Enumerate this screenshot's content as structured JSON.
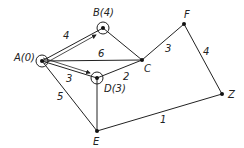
{
  "diagram": {
    "type": "weighted-graph",
    "nodes": [
      {
        "id": "A",
        "label": "A(0)",
        "x": 42,
        "y": 61,
        "circled": true
      },
      {
        "id": "B",
        "label": "B(4)",
        "x": 103,
        "y": 28,
        "circled": true
      },
      {
        "id": "C",
        "label": "C",
        "x": 142,
        "y": 60,
        "circled": false
      },
      {
        "id": "D",
        "label": "D(3)",
        "x": 97,
        "y": 78,
        "circled": true
      },
      {
        "id": "E",
        "label": "E",
        "x": 97,
        "y": 131,
        "circled": false
      },
      {
        "id": "F",
        "label": "F",
        "x": 184,
        "y": 24,
        "circled": false
      },
      {
        "id": "Z",
        "label": "Z",
        "x": 222,
        "y": 94,
        "circled": false
      }
    ],
    "edges": [
      {
        "from": "A",
        "to": "B",
        "weight": "4",
        "highlighted": true
      },
      {
        "from": "A",
        "to": "C",
        "weight": "6",
        "highlighted": false
      },
      {
        "from": "A",
        "to": "D",
        "weight": "3",
        "highlighted": true
      },
      {
        "from": "A",
        "to": "E",
        "weight": "5",
        "highlighted": false
      },
      {
        "from": "B",
        "to": "C",
        "weight": "",
        "highlighted": false
      },
      {
        "from": "D",
        "to": "C",
        "weight": "2",
        "highlighted": false
      },
      {
        "from": "D",
        "to": "E",
        "weight": "",
        "highlighted": false
      },
      {
        "from": "C",
        "to": "F",
        "weight": "3",
        "highlighted": false
      },
      {
        "from": "F",
        "to": "Z",
        "weight": "4",
        "highlighted": false
      },
      {
        "from": "E",
        "to": "Z",
        "weight": "1",
        "highlighted": false
      }
    ],
    "labels": {
      "A": "A(0)",
      "B": "B(4)",
      "C": "C",
      "D": "D(3)",
      "E": "E",
      "F": "F",
      "Z": "Z"
    },
    "weights": {
      "AB": "4",
      "AC": "6",
      "AD": "3",
      "AE": "5",
      "DC": "2",
      "CF": "3",
      "FZ": "4",
      "EZ": "1"
    }
  }
}
